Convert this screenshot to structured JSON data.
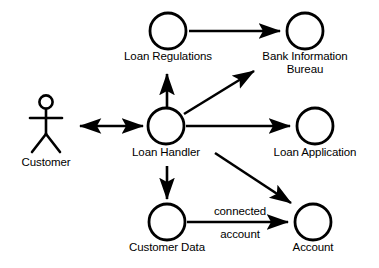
{
  "diagram": {
    "type": "uml-robustness-diagram",
    "background_color": "#ffffff",
    "stroke_color": "#000000",
    "width": 379,
    "height": 268,
    "actors": [
      {
        "id": "customer",
        "label": "Customer",
        "shape": "stick-figure",
        "x": 46,
        "y": 120,
        "label_x": 46,
        "label_y": 156
      }
    ],
    "nodes": [
      {
        "id": "loan-regulations",
        "label": "Loan Regulations",
        "shape": "circle",
        "cx": 168,
        "cy": 31,
        "r": 18,
        "label_x": 168,
        "label_y": 50
      },
      {
        "id": "bank-information-bureau",
        "label": "Bank Information\nBureau",
        "shape": "circle",
        "cx": 305,
        "cy": 31,
        "r": 18,
        "label_x": 305,
        "label_y": 50
      },
      {
        "id": "loan-handler",
        "label": "Loan Handler",
        "shape": "circle",
        "cx": 166,
        "cy": 126,
        "r": 18,
        "label_x": 166,
        "label_y": 146
      },
      {
        "id": "loan-application",
        "label": "Loan Application",
        "shape": "circle",
        "cx": 315,
        "cy": 126,
        "r": 18,
        "label_x": 315,
        "label_y": 146
      },
      {
        "id": "customer-data",
        "label": "Customer Data",
        "shape": "circle",
        "cx": 167,
        "cy": 222,
        "r": 18,
        "label_x": 167,
        "label_y": 241
      },
      {
        "id": "account",
        "label": "Account",
        "shape": "circle",
        "cx": 313,
        "cy": 222,
        "r": 18,
        "label_x": 313,
        "label_y": 241
      }
    ],
    "edges": [
      {
        "id": "loan-regulations-to-bank-information-bureau",
        "from": "loan-regulations",
        "to": "bank-information-bureau",
        "arrowheads": "end",
        "x1": 189,
        "y1": 31,
        "x2": 284,
        "y2": 31,
        "label": ""
      },
      {
        "id": "customer-to-loan-handler",
        "from": "customer",
        "to": "loan-handler",
        "arrowheads": "both",
        "x1": 78,
        "y1": 126,
        "x2": 145,
        "y2": 126,
        "label": ""
      },
      {
        "id": "loan-handler-to-loan-regulations",
        "from": "loan-handler",
        "to": "loan-regulations",
        "arrowheads": "end",
        "x1": 167,
        "y1": 107,
        "x2": 167,
        "y2": 71,
        "label": ""
      },
      {
        "id": "loan-handler-to-bank-information-bureau",
        "from": "loan-handler",
        "to": "bank-information-bureau",
        "arrowheads": "end",
        "x1": 184,
        "y1": 114,
        "x2": 257,
        "y2": 69,
        "label": ""
      },
      {
        "id": "loan-handler-to-loan-application",
        "from": "loan-handler",
        "to": "loan-application",
        "arrowheads": "end",
        "x1": 186,
        "y1": 126,
        "x2": 294,
        "y2": 126,
        "label": ""
      },
      {
        "id": "loan-handler-to-customer-data",
        "from": "loan-handler",
        "to": "customer-data",
        "arrowheads": "end",
        "x1": 167,
        "y1": 166,
        "x2": 167,
        "y2": 202,
        "label": ""
      },
      {
        "id": "loan-handler-to-account",
        "from": "loan-handler",
        "to": "account",
        "arrowheads": "end",
        "x1": 215,
        "y1": 153,
        "x2": 294,
        "y2": 205,
        "label": ""
      },
      {
        "id": "customer-data-to-account",
        "from": "customer-data",
        "to": "account",
        "arrowheads": "end",
        "x1": 187,
        "y1": 222,
        "x2": 292,
        "y2": 222,
        "label": "connected account"
      }
    ],
    "edge_labels": [
      {
        "id": "connected",
        "text": "connected",
        "x": 240,
        "y": 211
      },
      {
        "id": "account",
        "text": "account",
        "x": 240,
        "y": 234
      }
    ]
  }
}
